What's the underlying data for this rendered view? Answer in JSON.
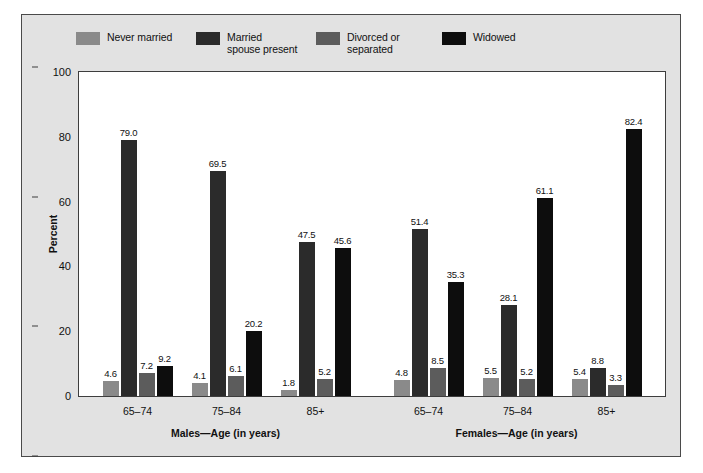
{
  "chart_data": {
    "type": "bar",
    "title": "",
    "xlabel": "",
    "ylabel": "Percent",
    "ylim": [
      0,
      100
    ],
    "yticks": [
      "0",
      "20",
      "40",
      "60",
      "80",
      "100"
    ],
    "grid": false,
    "legend_position": "top",
    "categories": [
      "65–74",
      "75–84",
      "85+",
      "65–74",
      "75–84",
      "85+"
    ],
    "sections": [
      {
        "label": "Males—Age (in years)",
        "categories": [
          "65–74",
          "75–84",
          "85+"
        ]
      },
      {
        "label": "Females—Age (in years)",
        "categories": [
          "65–74",
          "75–84",
          "85+"
        ]
      }
    ],
    "series": [
      {
        "name": "Never married",
        "color": "#8a8a8a",
        "values": [
          4.6,
          4.1,
          1.8,
          4.8,
          5.5,
          5.4
        ],
        "labels": [
          "4.6",
          "4.1",
          "1.8",
          "4.8",
          "5.5",
          "5.4"
        ]
      },
      {
        "name": "Married\nspouse present",
        "color": "#2b2b2b",
        "values": [
          79.0,
          69.5,
          47.5,
          51.4,
          28.1,
          8.8
        ],
        "labels": [
          "79.0",
          "69.5",
          "47.5",
          "51.4",
          "28.1",
          "8.8"
        ]
      },
      {
        "name": "Divorced or\nseparated",
        "color": "#5c5c5c",
        "values": [
          7.2,
          6.1,
          5.2,
          8.5,
          5.2,
          3.3
        ],
        "labels": [
          "7.2",
          "6.1",
          "5.2",
          "8.5",
          "5.2",
          "3.3"
        ]
      },
      {
        "name": "Widowed",
        "color": "#0d0d0d",
        "values": [
          9.2,
          20.2,
          45.6,
          35.3,
          61.1,
          82.4
        ],
        "labels": [
          "9.2",
          "20.2",
          "45.6",
          "35.3",
          "61.1",
          "82.4"
        ]
      }
    ]
  },
  "legend": {
    "items": [
      {
        "label": "Never married",
        "color": "#8a8a8a"
      },
      {
        "label": "Married\nspouse present",
        "color": "#2b2b2b"
      },
      {
        "label": "Divorced or\nseparated",
        "color": "#5c5c5c"
      },
      {
        "label": "Widowed",
        "color": "#0d0d0d"
      }
    ]
  },
  "axes": {
    "y_label": "Percent",
    "y_ticks": [
      "100",
      "80",
      "60",
      "40",
      "20",
      "0"
    ]
  }
}
